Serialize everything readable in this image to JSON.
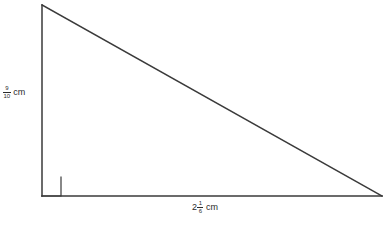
{
  "figure": {
    "type": "right-triangle",
    "background_color": "#ffffff",
    "stroke_color": "#3a3a3a",
    "stroke_width": 1.5,
    "vertices": {
      "apex": {
        "x": 42,
        "y": 5
      },
      "right_angle": {
        "x": 42,
        "y": 196
      },
      "base_right": {
        "x": 382,
        "y": 196
      }
    },
    "right_angle_marker": {
      "present": true,
      "size": 19,
      "x": 42,
      "y": 177
    }
  },
  "labels": {
    "height": {
      "whole": "",
      "numerator": "9",
      "denominator": "10",
      "unit": "cm",
      "full_text": "9/10 cm"
    },
    "base": {
      "whole": "2",
      "numerator": "1",
      "denominator": "6",
      "unit": "cm",
      "full_text": "2 1/6 cm"
    }
  }
}
